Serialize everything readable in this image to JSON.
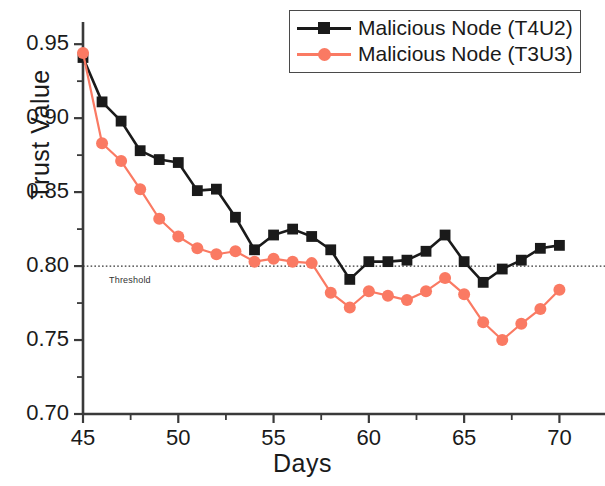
{
  "chart_data": {
    "type": "line",
    "title": "",
    "xlabel": "Days",
    "ylabel": "Trust Value",
    "xlim": [
      45,
      71.5
    ],
    "ylim": [
      0.7,
      0.965
    ],
    "xticks": [
      45,
      50,
      55,
      60,
      65,
      70
    ],
    "xtick_labels": [
      "45",
      "50",
      "55",
      "60",
      "65",
      "70"
    ],
    "yticks": [
      0.7,
      0.75,
      0.8,
      0.85,
      0.9,
      0.95
    ],
    "ytick_labels": [
      "0.70",
      "0.75",
      "0.80",
      "0.85",
      "0.90",
      "0.95"
    ],
    "minor_ticks": true,
    "grid": false,
    "legend_position": "top-right",
    "x": [
      45,
      46,
      47,
      48,
      49,
      50,
      51,
      52,
      53,
      54,
      55,
      56,
      57,
      58,
      59,
      60,
      61,
      62,
      63,
      64,
      65,
      66,
      67,
      68,
      69,
      70
    ],
    "series": [
      {
        "name": "Malicious Node (T4U2)",
        "color": "#1a1a1a",
        "marker": "square",
        "values": [
          0.941,
          0.911,
          0.898,
          0.878,
          0.872,
          0.87,
          0.851,
          0.852,
          0.833,
          0.811,
          0.821,
          0.825,
          0.82,
          0.811,
          0.791,
          0.803,
          0.803,
          0.804,
          0.81,
          0.821,
          0.803,
          0.789,
          0.798,
          0.804,
          0.812,
          0.814
        ]
      },
      {
        "name": "Malicious Node (T3U3)",
        "color": "#FA7A63",
        "marker": "circle",
        "values": [
          0.944,
          0.883,
          0.871,
          0.852,
          0.832,
          0.82,
          0.812,
          0.808,
          0.81,
          0.803,
          0.805,
          0.803,
          0.802,
          0.782,
          0.772,
          0.783,
          0.78,
          0.777,
          0.783,
          0.792,
          0.781,
          0.762,
          0.75,
          0.761,
          0.771,
          0.784
        ]
      }
    ],
    "annotations": [
      {
        "name": "threshold",
        "label": "Threshold",
        "y": 0.8,
        "style": "dotted",
        "color": "#333333"
      }
    ]
  },
  "legend": {
    "entries": [
      {
        "label": "Malicious Node (T4U2)",
        "color": "#1a1a1a",
        "marker": "square"
      },
      {
        "label": "Malicious Node (T3U3)",
        "color": "#FA7A63",
        "marker": "circle"
      }
    ]
  },
  "axes": {
    "y_title": "Trust Value",
    "x_title": "Days"
  }
}
